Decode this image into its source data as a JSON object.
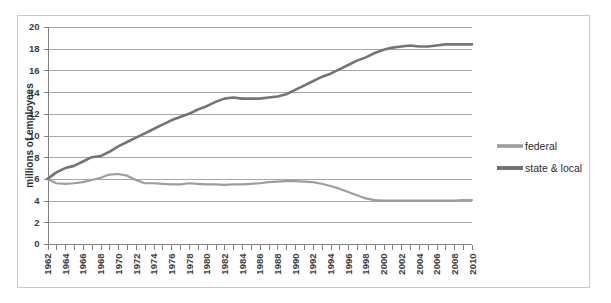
{
  "chart_data": {
    "type": "line",
    "title": "",
    "xlabel": "",
    "ylabel": "millions of employees",
    "ylim": [
      0,
      20
    ],
    "ytick_step": 2,
    "yticks": [
      "0",
      "2",
      "4",
      "6",
      "8",
      "10",
      "12",
      "14",
      "16",
      "18",
      "20"
    ],
    "xlim": [
      1962,
      2010
    ],
    "xtick_step": 2,
    "grid": "horizontal",
    "legend_position": "right",
    "x": [
      1962,
      1963,
      1964,
      1965,
      1966,
      1967,
      1968,
      1969,
      1970,
      1971,
      1972,
      1973,
      1974,
      1975,
      1976,
      1977,
      1978,
      1979,
      1980,
      1981,
      1982,
      1983,
      1984,
      1985,
      1986,
      1987,
      1988,
      1989,
      1990,
      1991,
      1992,
      1993,
      1994,
      1995,
      1996,
      1997,
      1998,
      1999,
      2000,
      2001,
      2002,
      2003,
      2004,
      2005,
      2006,
      2007,
      2008,
      2009,
      2010
    ],
    "xtick_labels": [
      "1962",
      "1964",
      "1966",
      "1968",
      "1970",
      "1972",
      "1974",
      "1976",
      "1978",
      "1980",
      "1982",
      "1984",
      "1986",
      "1988",
      "1990",
      "1992",
      "1994",
      "1996",
      "1998",
      "2000",
      "2002",
      "2004",
      "2006",
      "2008",
      "2010"
    ],
    "series": [
      {
        "name": "federal",
        "color": "#9d9d9d",
        "width": 2.2,
        "values": [
          6.0,
          5.6,
          5.55,
          5.6,
          5.7,
          5.9,
          6.1,
          6.4,
          6.45,
          6.3,
          5.9,
          5.6,
          5.6,
          5.55,
          5.5,
          5.5,
          5.6,
          5.55,
          5.5,
          5.5,
          5.45,
          5.5,
          5.5,
          5.55,
          5.6,
          5.7,
          5.75,
          5.8,
          5.8,
          5.75,
          5.7,
          5.55,
          5.35,
          5.1,
          4.8,
          4.5,
          4.2,
          4.05,
          4.0,
          4.0,
          4.0,
          4.0,
          4.0,
          4.0,
          4.0,
          4.0,
          4.0,
          4.05,
          4.05
        ],
        "endpoint_value": 4.05,
        "start_value": 6.0,
        "peak_value": 6.45,
        "peak_year": 1970,
        "min_value": 4.0
      },
      {
        "name": "state & local",
        "color": "#747474",
        "width": 2.6,
        "values": [
          6.0,
          6.6,
          7.0,
          7.2,
          7.6,
          8.0,
          8.1,
          8.5,
          9.0,
          9.4,
          9.8,
          10.2,
          10.6,
          11.0,
          11.4,
          11.7,
          12.0,
          12.4,
          12.7,
          13.1,
          13.4,
          13.5,
          13.4,
          13.4,
          13.4,
          13.5,
          13.6,
          13.8,
          14.2,
          14.6,
          15.0,
          15.4,
          15.7,
          16.1,
          16.5,
          16.9,
          17.2,
          17.6,
          17.9,
          18.1,
          18.2,
          18.3,
          18.2,
          18.2,
          18.3,
          18.4,
          18.4,
          18.4,
          18.4
        ],
        "endpoint_value": 18.4,
        "start_value": 6.0,
        "plateau_value": 13.4,
        "plateau_years": "1983-1987",
        "max_value": 18.4
      }
    ],
    "legend": [
      {
        "label": "federal",
        "color": "#9d9d9d",
        "width": 2.2
      },
      {
        "label": "state & local",
        "color": "#747474",
        "width": 2.6
      }
    ]
  },
  "style": {
    "gridline_color": "#a6a6a6",
    "axis_color": "#808080",
    "frame_color": "#c9c9c9",
    "text_color": "#3b3b3b",
    "background": "#ffffff"
  }
}
